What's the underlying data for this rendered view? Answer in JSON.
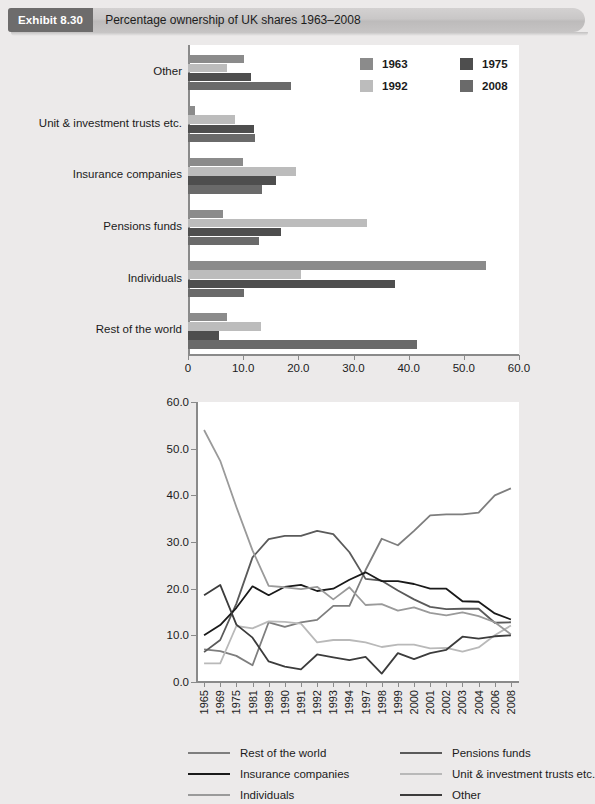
{
  "banner": {
    "tag": "Exhibit 8.30",
    "title": "Percentage ownership of UK shares 1963–2008"
  },
  "colors": {
    "y1963": "#8b8b8b",
    "y1975": "#4e4e4e",
    "y1992": "#bcbcbc",
    "y2008": "#6a6a6a",
    "rest_of_world": "#7e7e7e",
    "pensions_funds": "#5a5a5a",
    "insurance_companies": "#1a1a1a",
    "unit_trusts": "#b9b9b9",
    "individuals": "#9a9a9a",
    "other": "#3c3c3c",
    "axis": "#8a8a8a",
    "plot_bg": "#ffffff",
    "page_bg": "#eceaea"
  },
  "chart_data": [
    {
      "type": "bar",
      "orientation": "horizontal",
      "title": "",
      "xlabel": "",
      "ylabel": "",
      "xlim": [
        0,
        60
      ],
      "xticks": [
        "0",
        "10.0",
        "20.0",
        "30.0",
        "40.0",
        "50.0",
        "60.0"
      ],
      "grid": false,
      "legend_position": "top-right",
      "categories": [
        "Other",
        "Unit & investment trusts etc.",
        "Insurance companies",
        "Pensions funds",
        "Individuals",
        "Rest of the world"
      ],
      "series": [
        {
          "name": "1963",
          "color": "#8b8b8b",
          "values": [
            10.1,
            1.3,
            10.0,
            6.4,
            54.0,
            7.0
          ]
        },
        {
          "name": "1975",
          "color": "#4e4e4e",
          "values": [
            11.5,
            12.0,
            15.9,
            16.8,
            37.5,
            5.6
          ]
        },
        {
          "name": "1992",
          "color": "#bcbcbc",
          "values": [
            7.1,
            8.5,
            19.5,
            32.4,
            20.4,
            13.3
          ]
        },
        {
          "name": "2008",
          "color": "#6a6a6a",
          "values": [
            18.6,
            12.1,
            13.4,
            12.8,
            10.2,
            41.5
          ]
        }
      ],
      "series_draw_order_top_to_bottom": [
        "1963",
        "1992",
        "1975",
        "2008"
      ]
    },
    {
      "type": "line",
      "title": "",
      "xlabel": "",
      "ylabel": "",
      "ylim": [
        0,
        60
      ],
      "yticks": [
        "0.0",
        "10.0",
        "20.0",
        "30.0",
        "40.0",
        "50.0",
        "60.0"
      ],
      "grid": false,
      "legend_position": "bottom",
      "x": [
        "1965",
        "1969",
        "1975",
        "1981",
        "1989",
        "1990",
        "1991",
        "1992",
        "1993",
        "1994",
        "1997",
        "1998",
        "1999",
        "2000",
        "2001",
        "2002",
        "2003",
        "2004",
        "2006",
        "2008"
      ],
      "series": [
        {
          "name": "Rest of the world",
          "color": "#7e7e7e",
          "values": [
            7.0,
            6.6,
            5.6,
            3.6,
            12.8,
            11.8,
            12.8,
            13.3,
            16.3,
            16.3,
            24.0,
            30.7,
            29.3,
            32.4,
            35.7,
            35.9,
            35.9,
            36.3,
            40.0,
            41.5
          ]
        },
        {
          "name": "Pensions funds",
          "color": "#5a5a5a",
          "values": [
            6.4,
            9.0,
            16.8,
            26.7,
            30.6,
            31.3,
            31.3,
            32.4,
            31.7,
            27.8,
            22.1,
            21.7,
            19.6,
            17.7,
            16.1,
            15.6,
            15.7,
            15.7,
            12.7,
            12.8
          ]
        },
        {
          "name": "Insurance companies",
          "color": "#1a1a1a",
          "values": [
            10.0,
            12.2,
            15.9,
            20.5,
            18.6,
            20.4,
            20.8,
            19.5,
            20.0,
            21.9,
            23.5,
            21.6,
            21.6,
            21.0,
            20.0,
            20.0,
            17.3,
            17.2,
            14.7,
            13.4
          ]
        },
        {
          "name": "Unit & investment trusts etc.",
          "color": "#b9b9b9",
          "values": [
            4.0,
            4.0,
            12.0,
            11.5,
            13.0,
            12.9,
            12.5,
            8.5,
            9.0,
            9.0,
            8.5,
            7.5,
            8.0,
            8.0,
            7.2,
            7.3,
            6.5,
            7.4,
            10.0,
            12.1
          ]
        },
        {
          "name": "Individuals",
          "color": "#9a9a9a",
          "values": [
            54.0,
            47.4,
            37.5,
            28.2,
            20.6,
            20.3,
            19.9,
            20.4,
            17.7,
            20.3,
            16.5,
            16.7,
            15.3,
            16.0,
            14.8,
            14.3,
            14.9,
            14.1,
            12.8,
            10.2
          ]
        },
        {
          "name": "Other",
          "color": "#3c3c3c",
          "values": [
            18.6,
            20.8,
            12.3,
            9.5,
            4.4,
            3.3,
            2.7,
            5.9,
            5.3,
            4.7,
            5.4,
            1.8,
            6.2,
            4.9,
            6.2,
            6.9,
            9.7,
            9.3,
            9.8,
            10.0
          ]
        }
      ],
      "legend_items": [
        {
          "label": "Rest of the world",
          "color": "#7e7e7e"
        },
        {
          "label": "Pensions funds",
          "color": "#5a5a5a"
        },
        {
          "label": "Insurance companies",
          "color": "#1a1a1a"
        },
        {
          "label": "Unit & investment trusts etc.",
          "color": "#b9b9b9"
        },
        {
          "label": "Individuals",
          "color": "#9a9a9a"
        },
        {
          "label": "Other",
          "color": "#3c3c3c"
        }
      ]
    }
  ]
}
